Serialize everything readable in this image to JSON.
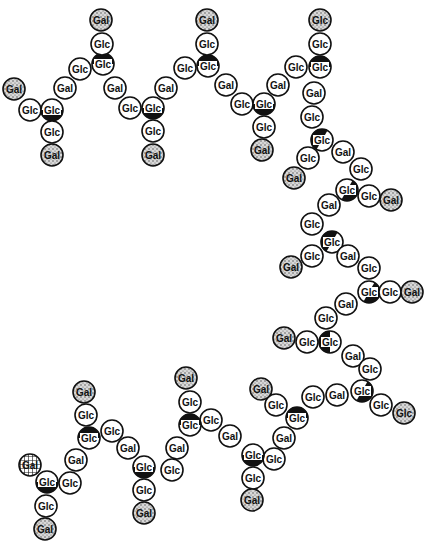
{
  "diagram": {
    "node_radius": 11,
    "colors": {
      "outline": "#111111",
      "plain": "#ffffff",
      "stipple": "#bdbdbd",
      "branch_fill": "#111111"
    },
    "legend_types": {
      "plain": "unsubstituted residue (white circle)",
      "stipple": "terminal residue (stippled circle)",
      "branch": "branch-point Glc (half-black circle)",
      "hatched": "terminal Gal (cross-hatched circle)"
    },
    "nodes": [
      {
        "id": "n1",
        "label": "Gal",
        "x": 14,
        "y": 89,
        "type": "stipple"
      },
      {
        "id": "n2",
        "label": "Glc",
        "x": 30,
        "y": 110,
        "type": "plain"
      },
      {
        "id": "n3",
        "label": "Glc",
        "x": 52,
        "y": 110,
        "type": "branch",
        "rot": 180
      },
      {
        "id": "n4",
        "label": "Glc",
        "x": 52,
        "y": 132,
        "type": "plain"
      },
      {
        "id": "n5",
        "label": "Gal",
        "x": 52,
        "y": 155,
        "type": "stipple"
      },
      {
        "id": "n6",
        "label": "Gal",
        "x": 65,
        "y": 88,
        "type": "plain"
      },
      {
        "id": "n7",
        "label": "Glc",
        "x": 80,
        "y": 69,
        "type": "plain"
      },
      {
        "id": "n8",
        "label": "Glc",
        "x": 103,
        "y": 64,
        "type": "branch",
        "rot": 0
      },
      {
        "id": "n9",
        "label": "Glc",
        "x": 102,
        "y": 44,
        "type": "plain"
      },
      {
        "id": "n10",
        "label": "Gal",
        "x": 101,
        "y": 20,
        "type": "stipple"
      },
      {
        "id": "n11",
        "label": "Gal",
        "x": 115,
        "y": 88,
        "type": "plain"
      },
      {
        "id": "n12",
        "label": "Glc",
        "x": 130,
        "y": 108,
        "type": "plain"
      },
      {
        "id": "n13",
        "label": "Glc",
        "x": 153,
        "y": 108,
        "type": "branch",
        "rot": 180
      },
      {
        "id": "n14",
        "label": "Glc",
        "x": 153,
        "y": 131,
        "type": "plain"
      },
      {
        "id": "n15",
        "label": "Gal",
        "x": 153,
        "y": 155,
        "type": "stipple"
      },
      {
        "id": "n16",
        "label": "Gal",
        "x": 166,
        "y": 88,
        "type": "plain"
      },
      {
        "id": "n17",
        "label": "Glc",
        "x": 185,
        "y": 68,
        "type": "plain"
      },
      {
        "id": "n18",
        "label": "Glc",
        "x": 208,
        "y": 66,
        "type": "branch",
        "rot": 0
      },
      {
        "id": "n19",
        "label": "Glc",
        "x": 207,
        "y": 44,
        "type": "plain"
      },
      {
        "id": "n20",
        "label": "Gal",
        "x": 207,
        "y": 20,
        "type": "stipple"
      },
      {
        "id": "n21",
        "label": "Gal",
        "x": 226,
        "y": 85,
        "type": "plain"
      },
      {
        "id": "n22",
        "label": "Glc",
        "x": 242,
        "y": 104,
        "type": "plain"
      },
      {
        "id": "n23",
        "label": "Glc",
        "x": 264,
        "y": 104,
        "type": "branch",
        "rot": 180
      },
      {
        "id": "n24",
        "label": "Glc",
        "x": 264,
        "y": 127,
        "type": "plain"
      },
      {
        "id": "n25",
        "label": "Gal",
        "x": 262,
        "y": 150,
        "type": "stipple"
      },
      {
        "id": "n26",
        "label": "Gal",
        "x": 278,
        "y": 85,
        "type": "plain"
      },
      {
        "id": "n27",
        "label": "Glc",
        "x": 296,
        "y": 67,
        "type": "plain"
      },
      {
        "id": "n28",
        "label": "Glc",
        "x": 320,
        "y": 67,
        "type": "branch",
        "rot": 0
      },
      {
        "id": "n29",
        "label": "Glc",
        "x": 320,
        "y": 44,
        "type": "plain"
      },
      {
        "id": "n30",
        "label": "Glc",
        "x": 320,
        "y": 20,
        "type": "stipple"
      },
      {
        "id": "n31",
        "label": "Gal",
        "x": 314,
        "y": 93,
        "type": "plain"
      },
      {
        "id": "n32",
        "label": "Glc",
        "x": 312,
        "y": 117,
        "type": "plain"
      },
      {
        "id": "n33",
        "label": "Glc",
        "x": 322,
        "y": 140,
        "type": "branch",
        "rot": -60
      },
      {
        "id": "n34",
        "label": "Glc",
        "x": 308,
        "y": 158,
        "type": "plain"
      },
      {
        "id": "n35",
        "label": "Gal",
        "x": 294,
        "y": 178,
        "type": "stipple"
      },
      {
        "id": "n36",
        "label": "Gal",
        "x": 343,
        "y": 152,
        "type": "plain"
      },
      {
        "id": "n37",
        "label": "Glc",
        "x": 361,
        "y": 169,
        "type": "plain"
      },
      {
        "id": "n38",
        "label": "Glc",
        "x": 347,
        "y": 190,
        "type": "branch",
        "rot": 120
      },
      {
        "id": "n39",
        "label": "Glc",
        "x": 369,
        "y": 196,
        "type": "plain"
      },
      {
        "id": "n40",
        "label": "Gal",
        "x": 391,
        "y": 200,
        "type": "stipple"
      },
      {
        "id": "n41",
        "label": "Gal",
        "x": 329,
        "y": 205,
        "type": "plain"
      },
      {
        "id": "n42",
        "label": "Glc",
        "x": 312,
        "y": 224,
        "type": "plain"
      },
      {
        "id": "n43",
        "label": "Glc",
        "x": 332,
        "y": 242,
        "type": "branch",
        "rot": -60
      },
      {
        "id": "n44",
        "label": "Glc",
        "x": 312,
        "y": 256,
        "type": "plain"
      },
      {
        "id": "n45",
        "label": "Gal",
        "x": 291,
        "y": 267,
        "type": "stipple"
      },
      {
        "id": "n46",
        "label": "Gal",
        "x": 348,
        "y": 256,
        "type": "plain"
      },
      {
        "id": "n47",
        "label": "Glc",
        "x": 369,
        "y": 268,
        "type": "plain"
      },
      {
        "id": "n48",
        "label": "Glc",
        "x": 369,
        "y": 292,
        "type": "branch",
        "rot": 120
      },
      {
        "id": "n49",
        "label": "Glc",
        "x": 390,
        "y": 292,
        "type": "plain"
      },
      {
        "id": "n50",
        "label": "Gal",
        "x": 412,
        "y": 292,
        "type": "stipple"
      },
      {
        "id": "n51",
        "label": "Gal",
        "x": 346,
        "y": 304,
        "type": "plain"
      },
      {
        "id": "n52",
        "label": "Glc",
        "x": 326,
        "y": 318,
        "type": "plain"
      },
      {
        "id": "n53",
        "label": "Glc",
        "x": 330,
        "y": 342,
        "type": "branch",
        "rot": -90
      },
      {
        "id": "n54",
        "label": "Glc",
        "x": 307,
        "y": 342,
        "type": "plain"
      },
      {
        "id": "n55",
        "label": "Gal",
        "x": 284,
        "y": 338,
        "type": "stipple"
      },
      {
        "id": "n56",
        "label": "Gal",
        "x": 353,
        "y": 356,
        "type": "plain"
      },
      {
        "id": "n57",
        "label": "Glc",
        "x": 370,
        "y": 369,
        "type": "plain"
      },
      {
        "id": "n58",
        "label": "Glc",
        "x": 362,
        "y": 391,
        "type": "branch",
        "rot": 120
      },
      {
        "id": "n59",
        "label": "Glc",
        "x": 381,
        "y": 405,
        "type": "plain"
      },
      {
        "id": "n60",
        "label": "Glc",
        "x": 404,
        "y": 413,
        "type": "stipple"
      },
      {
        "id": "n61",
        "label": "Gal",
        "x": 337,
        "y": 395,
        "type": "plain"
      },
      {
        "id": "n62",
        "label": "Glc",
        "x": 313,
        "y": 397,
        "type": "plain"
      },
      {
        "id": "n63",
        "label": "Glc",
        "x": 297,
        "y": 418,
        "type": "branch",
        "rot": 0
      },
      {
        "id": "n64",
        "label": "Glc",
        "x": 276,
        "y": 405,
        "type": "plain"
      },
      {
        "id": "n65",
        "label": "Gal",
        "x": 261,
        "y": 389,
        "type": "stipple"
      },
      {
        "id": "n66",
        "label": "Gal",
        "x": 284,
        "y": 438,
        "type": "plain"
      },
      {
        "id": "n67",
        "label": "Glc",
        "x": 274,
        "y": 459,
        "type": "plain"
      },
      {
        "id": "n68",
        "label": "Glc",
        "x": 253,
        "y": 455,
        "type": "branch",
        "rot": 180
      },
      {
        "id": "n69",
        "label": "Glc",
        "x": 253,
        "y": 478,
        "type": "plain"
      },
      {
        "id": "n70",
        "label": "Gal",
        "x": 252,
        "y": 500,
        "type": "stipple"
      },
      {
        "id": "n71",
        "label": "Gal",
        "x": 230,
        "y": 436,
        "type": "plain"
      },
      {
        "id": "n72",
        "label": "Glc",
        "x": 211,
        "y": 420,
        "type": "plain"
      },
      {
        "id": "n73",
        "label": "Glc",
        "x": 190,
        "y": 425,
        "type": "branch",
        "rot": 0
      },
      {
        "id": "n74",
        "label": "Glc",
        "x": 190,
        "y": 402,
        "type": "plain"
      },
      {
        "id": "n75",
        "label": "Gal",
        "x": 186,
        "y": 378,
        "type": "stipple"
      },
      {
        "id": "n76",
        "label": "Gal",
        "x": 177,
        "y": 448,
        "type": "plain"
      },
      {
        "id": "n77",
        "label": "Glc",
        "x": 172,
        "y": 470,
        "type": "plain"
      },
      {
        "id": "n78",
        "label": "Glc",
        "x": 144,
        "y": 467,
        "type": "branch",
        "rot": 180
      },
      {
        "id": "n79",
        "label": "Glc",
        "x": 144,
        "y": 490,
        "type": "plain"
      },
      {
        "id": "n80",
        "label": "Gal",
        "x": 144,
        "y": 513,
        "type": "stipple"
      },
      {
        "id": "n81",
        "label": "Gal",
        "x": 128,
        "y": 448,
        "type": "plain"
      },
      {
        "id": "n82",
        "label": "Glc",
        "x": 112,
        "y": 431,
        "type": "plain"
      },
      {
        "id": "n83",
        "label": "Glc",
        "x": 89,
        "y": 438,
        "type": "branch",
        "rot": 0
      },
      {
        "id": "n84",
        "label": "Glc",
        "x": 86,
        "y": 415,
        "type": "plain"
      },
      {
        "id": "n85",
        "label": "Gal",
        "x": 84,
        "y": 392,
        "type": "stipple"
      },
      {
        "id": "n86",
        "label": "Gal",
        "x": 76,
        "y": 460,
        "type": "plain"
      },
      {
        "id": "n87",
        "label": "Glc",
        "x": 70,
        "y": 483,
        "type": "plain"
      },
      {
        "id": "n88",
        "label": "Glc",
        "x": 47,
        "y": 482,
        "type": "branch",
        "rot": 180
      },
      {
        "id": "n89",
        "label": "Gal",
        "x": 30,
        "y": 465,
        "type": "hatched"
      },
      {
        "id": "n90",
        "label": "Glc",
        "x": 46,
        "y": 506,
        "type": "plain"
      },
      {
        "id": "n91",
        "label": "Gal",
        "x": 45,
        "y": 529,
        "type": "stipple"
      }
    ]
  }
}
